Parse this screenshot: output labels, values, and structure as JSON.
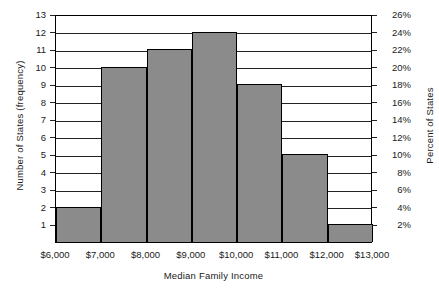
{
  "chart_data": {
    "type": "bar",
    "title": "",
    "subtitle": "",
    "xlabel": "Median Family Income",
    "ylabel": "Number of States (frequency)",
    "y2label": "Percent of States",
    "categories": [
      "$6,000-$7,000",
      "$7,000-$8,000",
      "$8,000-$9,000",
      "$9,000-$10,000",
      "$10,000-$11,000",
      "$11,000-$12,000",
      "$12,000-$13,000"
    ],
    "values": [
      2,
      10,
      11,
      12,
      9,
      5,
      1
    ],
    "percent_values": [
      "4%",
      "20%",
      "22%",
      "24%",
      "18%",
      "10%",
      "2%"
    ],
    "bin_edges": [
      "$6,000",
      "$7,000",
      "$8,000",
      "$9,000",
      "$10,000",
      "$11,000",
      "$12,000",
      "$13,000"
    ],
    "x_tick_labels": [
      "$6,000",
      "$7,000",
      "$8,000",
      "$9,000",
      "$10,000",
      "$11,000",
      "$12,000",
      "$13,000"
    ],
    "y_tick_labels": [
      "1",
      "2",
      "3",
      "4",
      "5",
      "6",
      "7",
      "8",
      "9",
      "10",
      "11",
      "12",
      "13"
    ],
    "y2_tick_labels": [
      "2%",
      "4%",
      "6%",
      "8%",
      "10%",
      "12%",
      "14%",
      "16%",
      "18%",
      "20%",
      "22%",
      "24%",
      "26%"
    ],
    "ylim": [
      0,
      13
    ],
    "y2lim": [
      0,
      26
    ],
    "grid": "horizontal",
    "legend": "none",
    "bar_color": "#8b8b8b",
    "bar_edge_color": "#000000",
    "axis_color": "#000000",
    "background_color": "#ffffff"
  }
}
